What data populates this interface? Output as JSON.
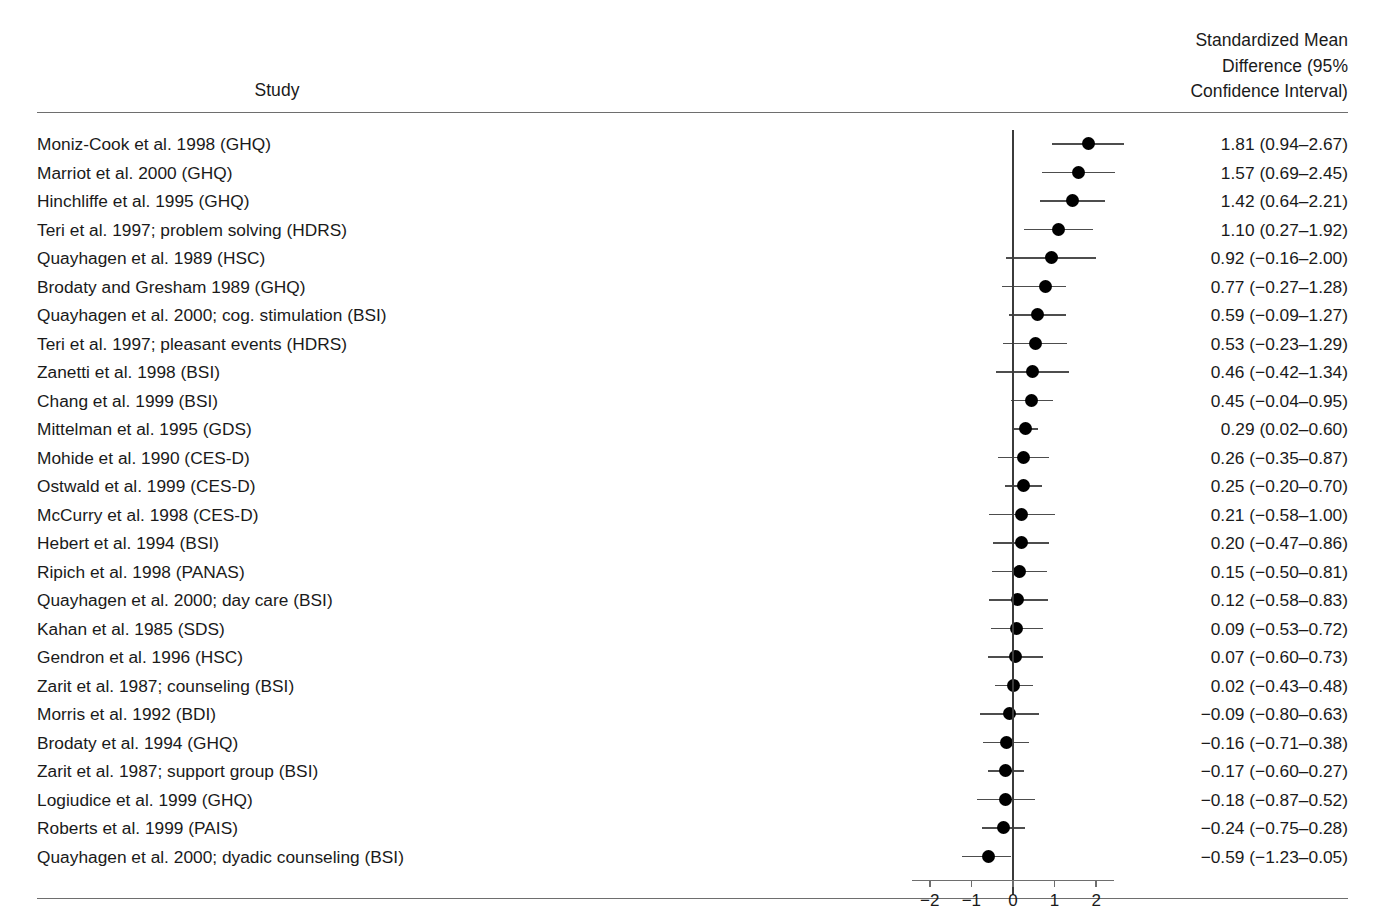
{
  "header": {
    "study_column": "Study",
    "effect_column_lines": [
      "Standardized Mean",
      "Difference (95%",
      "Confidence Interval)"
    ]
  },
  "chart_data": {
    "type": "forest",
    "title": "",
    "xlabel": "",
    "ylabel": "",
    "xlim": [
      -2.6,
      2.9
    ],
    "axis_ticks": [
      "−2",
      "−1",
      "0",
      "1",
      "2"
    ],
    "axis_tick_values": [
      -2,
      -1,
      0,
      1,
      2
    ],
    "reference_line": 0,
    "grid": false,
    "legend": "none",
    "marker_color": "#000000",
    "line_color": "#4d4d4d",
    "effect_measure": "Standardized Mean Difference (95% Confidence Interval)",
    "rows": [
      {
        "study": "Moniz-Cook et al. 1998 (GHQ)",
        "estimate": 1.81,
        "lower": 0.94,
        "upper": 2.67,
        "value_text": "1.81 (0.94–2.67)"
      },
      {
        "study": "Marriot et al. 2000 (GHQ)",
        "estimate": 1.57,
        "lower": 0.69,
        "upper": 2.45,
        "value_text": "1.57 (0.69–2.45)"
      },
      {
        "study": "Hinchliffe et al. 1995 (GHQ)",
        "estimate": 1.42,
        "lower": 0.64,
        "upper": 2.21,
        "value_text": "1.42 (0.64–2.21)"
      },
      {
        "study": "Teri et al. 1997; problem solving (HDRS)",
        "estimate": 1.1,
        "lower": 0.27,
        "upper": 1.92,
        "value_text": "1.10 (0.27–1.92)"
      },
      {
        "study": "Quayhagen et al. 1989 (HSC)",
        "estimate": 0.92,
        "lower": -0.16,
        "upper": 2.0,
        "value_text": "0.92 (−0.16–2.00)"
      },
      {
        "study": "Brodaty and Gresham 1989 (GHQ)",
        "estimate": 0.77,
        "lower": -0.27,
        "upper": 1.28,
        "value_text": "0.77 (−0.27–1.28)"
      },
      {
        "study": "Quayhagen et al. 2000; cog. stimulation (BSI)",
        "estimate": 0.59,
        "lower": -0.09,
        "upper": 1.27,
        "value_text": "0.59 (−0.09–1.27)"
      },
      {
        "study": "Teri et al. 1997; pleasant events (HDRS)",
        "estimate": 0.53,
        "lower": -0.23,
        "upper": 1.29,
        "value_text": "0.53 (−0.23–1.29)"
      },
      {
        "study": "Zanetti et al. 1998 (BSI)",
        "estimate": 0.46,
        "lower": -0.42,
        "upper": 1.34,
        "value_text": "0.46 (−0.42–1.34)"
      },
      {
        "study": "Chang et al. 1999 (BSI)",
        "estimate": 0.45,
        "lower": -0.04,
        "upper": 0.95,
        "value_text": "0.45 (−0.04–0.95)"
      },
      {
        "study": "Mittelman et al. 1995 (GDS)",
        "estimate": 0.29,
        "lower": 0.02,
        "upper": 0.6,
        "value_text": "0.29 (0.02–0.60)"
      },
      {
        "study": "Mohide et al. 1990 (CES-D)",
        "estimate": 0.26,
        "lower": -0.35,
        "upper": 0.87,
        "value_text": "0.26 (−0.35–0.87)"
      },
      {
        "study": "Ostwald et al. 1999 (CES-D)",
        "estimate": 0.25,
        "lower": -0.2,
        "upper": 0.7,
        "value_text": "0.25 (−0.20–0.70)"
      },
      {
        "study": "McCurry et al. 1998 (CES-D)",
        "estimate": 0.21,
        "lower": -0.58,
        "upper": 1.0,
        "value_text": "0.21 (−0.58–1.00)"
      },
      {
        "study": "Hebert et al. 1994 (BSI)",
        "estimate": 0.2,
        "lower": -0.47,
        "upper": 0.86,
        "value_text": "0.20 (−0.47–0.86)"
      },
      {
        "study": "Ripich et al. 1998 (PANAS)",
        "estimate": 0.15,
        "lower": -0.5,
        "upper": 0.81,
        "value_text": "0.15 (−0.50–0.81)"
      },
      {
        "study": "Quayhagen et al. 2000; day care (BSI)",
        "estimate": 0.12,
        "lower": -0.58,
        "upper": 0.83,
        "value_text": "0.12 (−0.58–0.83)"
      },
      {
        "study": "Kahan et al. 1985 (SDS)",
        "estimate": 0.09,
        "lower": -0.53,
        "upper": 0.72,
        "value_text": "0.09 (−0.53–0.72)"
      },
      {
        "study": "Gendron et al. 1996 (HSC)",
        "estimate": 0.07,
        "lower": -0.6,
        "upper": 0.73,
        "value_text": "0.07 (−0.60–0.73)"
      },
      {
        "study": "Zarit et al. 1987; counseling (BSI)",
        "estimate": 0.02,
        "lower": -0.43,
        "upper": 0.48,
        "value_text": "0.02 (−0.43–0.48)"
      },
      {
        "study": "Morris et al. 1992 (BDI)",
        "estimate": -0.09,
        "lower": -0.8,
        "upper": 0.63,
        "value_text": "−0.09 (−0.80–0.63)"
      },
      {
        "study": "Brodaty et al. 1994 (GHQ)",
        "estimate": -0.16,
        "lower": -0.71,
        "upper": 0.38,
        "value_text": "−0.16 (−0.71–0.38)"
      },
      {
        "study": "Zarit et al. 1987; support group (BSI)",
        "estimate": -0.17,
        "lower": -0.6,
        "upper": 0.27,
        "value_text": "−0.17 (−0.60–0.27)"
      },
      {
        "study": "Logiudice et al. 1999 (GHQ)",
        "estimate": -0.18,
        "lower": -0.87,
        "upper": 0.52,
        "value_text": "−0.18 (−0.87–0.52)"
      },
      {
        "study": "Roberts et al. 1999 (PAIS)",
        "estimate": -0.24,
        "lower": -0.75,
        "upper": 0.28,
        "value_text": "−0.24 (−0.75–0.28)"
      },
      {
        "study": "Quayhagen et al. 2000; dyadic counseling (BSI)",
        "estimate": -0.59,
        "lower": -1.23,
        "upper": -0.05,
        "value_text": "−0.59 (−1.23–0.05)"
      }
    ]
  }
}
